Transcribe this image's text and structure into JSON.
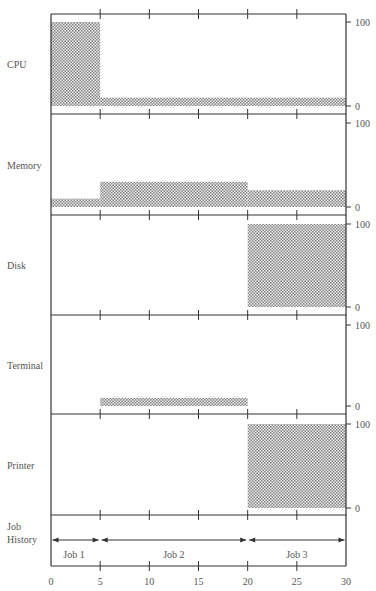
{
  "chart_data": {
    "type": "area",
    "title": "",
    "xlabel": "",
    "x_ticks": [
      0,
      5,
      10,
      15,
      20,
      25,
      30
    ],
    "xlim": [
      0,
      30
    ],
    "panel_ylim": [
      0,
      100
    ],
    "panel_yticks": [
      0,
      100
    ],
    "grid": false,
    "fill_pattern": "dotted",
    "fill_color": "#bdbdbd",
    "series": [
      {
        "name": "CPU",
        "segments": [
          {
            "x0": 0,
            "x1": 5,
            "value": 100
          },
          {
            "x0": 5,
            "x1": 30,
            "value": 10
          }
        ]
      },
      {
        "name": "Memory",
        "segments": [
          {
            "x0": 0,
            "x1": 5,
            "value": 10
          },
          {
            "x0": 5,
            "x1": 20,
            "value": 30
          },
          {
            "x0": 20,
            "x1": 30,
            "value": 20
          }
        ]
      },
      {
        "name": "Disk",
        "segments": [
          {
            "x0": 0,
            "x1": 20,
            "value": 0
          },
          {
            "x0": 20,
            "x1": 30,
            "value": 100
          }
        ]
      },
      {
        "name": "Terminal",
        "segments": [
          {
            "x0": 0,
            "x1": 5,
            "value": 0
          },
          {
            "x0": 5,
            "x1": 20,
            "value": 10
          },
          {
            "x0": 20,
            "x1": 30,
            "value": 0
          }
        ]
      },
      {
        "name": "Printer",
        "segments": [
          {
            "x0": 0,
            "x1": 20,
            "value": 0
          },
          {
            "x0": 20,
            "x1": 30,
            "value": 100
          }
        ]
      }
    ],
    "job_history": {
      "label_line1": "Job",
      "label_line2": "History",
      "jobs": [
        {
          "name": "Job 1",
          "start": 0,
          "end": 5
        },
        {
          "name": "Job 2",
          "start": 5,
          "end": 20
        },
        {
          "name": "Job 3",
          "start": 20,
          "end": 30
        }
      ]
    }
  }
}
